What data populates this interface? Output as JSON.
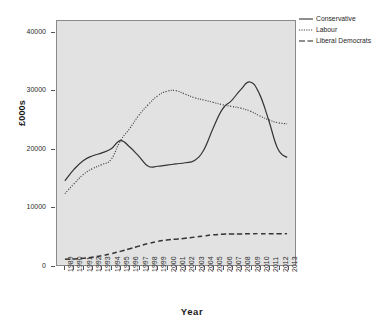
{
  "chart_data": {
    "type": "line",
    "title": "",
    "xlabel": "Year",
    "ylabel": "£000s",
    "grid": false,
    "legend_position": "top-right-outside",
    "xlim": [
      1989,
      2013
    ],
    "ylim": [
      0,
      42000
    ],
    "yticks": [
      0,
      10000,
      20000,
      30000,
      40000
    ],
    "ytick_labels": [
      "0",
      "10000",
      "20000",
      "30000",
      "40000"
    ],
    "categories": [
      "1989",
      "1990",
      "1991",
      "1992",
      "1993",
      "1994",
      "1995",
      "1996",
      "1997",
      "1998",
      "1999",
      "2000",
      "2001",
      "2002",
      "2003",
      "2004",
      "2005",
      "2006",
      "2007",
      "2008",
      "2009",
      "2010",
      "2011",
      "2012",
      "2013"
    ],
    "series": [
      {
        "name": "Conservative",
        "style": "solid",
        "color": "#333333",
        "values": [
          14500,
          16500,
          18000,
          18800,
          19300,
          20000,
          21400,
          20300,
          18700,
          17000,
          17000,
          17200,
          17400,
          17600,
          18000,
          19800,
          23500,
          26800,
          28300,
          30200,
          31500,
          29500,
          25000,
          20000,
          18500
        ]
      },
      {
        "name": "Labour",
        "style": "dotted",
        "color": "#444444",
        "values": [
          12300,
          14000,
          15600,
          16600,
          17300,
          18200,
          21400,
          23500,
          25800,
          27600,
          29100,
          29900,
          30000,
          29400,
          28800,
          28400,
          28000,
          27600,
          27300,
          27000,
          26500,
          25700,
          25000,
          24500,
          24300
        ]
      },
      {
        "name": "Liberal Democrats",
        "style": "dashed",
        "color": "#333333",
        "values": [
          1000,
          1050,
          1150,
          1350,
          1600,
          1950,
          2350,
          2800,
          3250,
          3700,
          4050,
          4300,
          4450,
          4600,
          4800,
          5000,
          5200,
          5300,
          5320,
          5350,
          5380,
          5400,
          5380,
          5380,
          5400
        ]
      }
    ]
  },
  "legend": {
    "items": [
      {
        "label": "Conservative"
      },
      {
        "label": "Labour"
      },
      {
        "label": "Liberal Democrats"
      }
    ]
  },
  "axes": {
    "x_title": "Year",
    "y_title": "£000s"
  }
}
